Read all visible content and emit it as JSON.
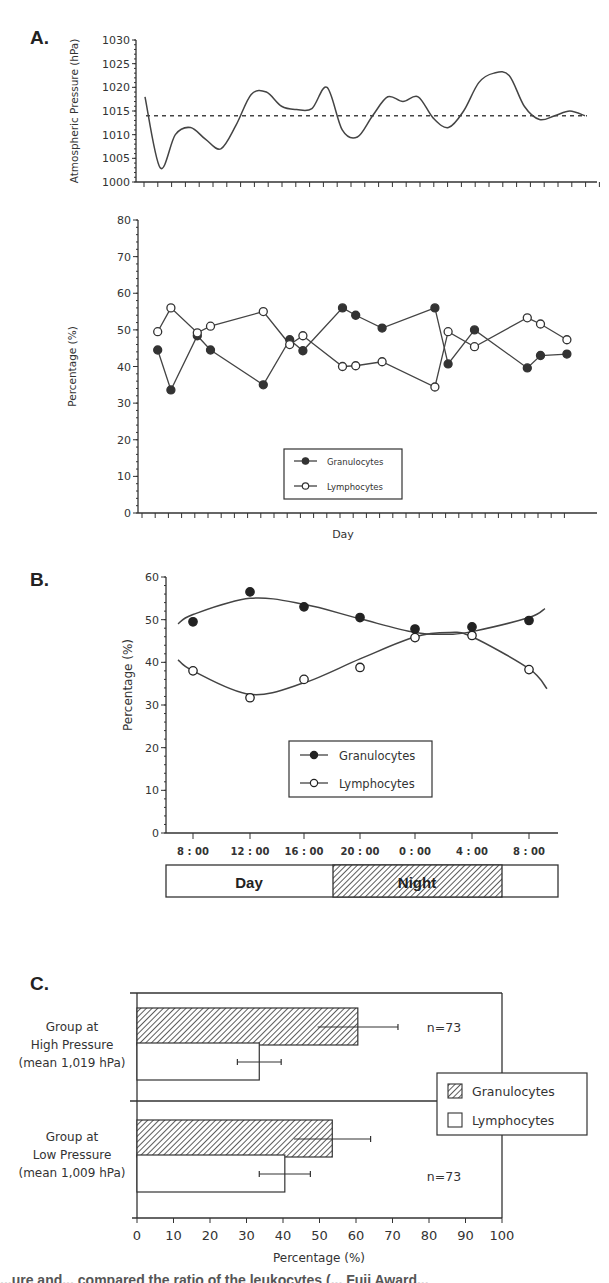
{
  "panels": {
    "A": {
      "letter": "A."
    },
    "B": {
      "letter": "B."
    },
    "C": {
      "letter": "C."
    }
  },
  "chart_data": [
    {
      "id": "A-pressure",
      "type": "line",
      "title": "",
      "xlabel": "",
      "ylabel": "Atmospheric Pressure (hPa)",
      "ylim": [
        1000,
        1030
      ],
      "yticks": [
        1000,
        1005,
        1010,
        1015,
        1020,
        1025,
        1030
      ],
      "reference_line": {
        "y": 1014,
        "style": "dashed"
      },
      "series": [
        {
          "name": "Pressure",
          "x": [
            0,
            0.5,
            1.2,
            2,
            2.8,
            3.5,
            4.5,
            5.5,
            6.2,
            7,
            7.8,
            8.5,
            9.2,
            10,
            10.8,
            11.5,
            12.5,
            13.5,
            14.5,
            15.5,
            16.2,
            17.2,
            18.2,
            19.2,
            20,
            21,
            22,
            23,
            24,
            25,
            26,
            27,
            28,
            28.8
          ],
          "values": [
            1018,
            1003,
            1010,
            1011.5,
            1009,
            1007,
            1012,
            1018.5,
            1019,
            1016,
            1015.3,
            1015.5,
            1020,
            1011,
            1009.5,
            1014,
            1018,
            1017,
            1018,
            1013.5,
            1011.5,
            1015,
            1021,
            1023,
            1022.5,
            1016,
            1013.2,
            1014,
            1015,
            1014
          ]
        }
      ],
      "grid": false
    },
    {
      "id": "A-percentage",
      "type": "line",
      "title": "",
      "xlabel": "Day",
      "ylabel": "Percentage (%)",
      "ylim": [
        0,
        80
      ],
      "yticks": [
        0,
        10,
        20,
        30,
        40,
        50,
        60,
        70,
        80
      ],
      "x_tick_count": 33,
      "x": [
        1,
        2,
        4,
        5,
        9,
        11,
        12,
        15,
        16,
        18,
        22,
        23,
        25,
        29,
        30,
        32
      ],
      "series": [
        {
          "name": "Granulocytes",
          "marker": "filled-circle",
          "values": [
            44.5,
            33.6,
            48.4,
            44.5,
            35.0,
            47.3,
            44.3,
            56.0,
            54.0,
            50.5,
            56.0,
            40.7,
            50.0,
            39.6,
            43.0,
            43.4
          ]
        },
        {
          "name": "Lymphocytes",
          "marker": "open-circle",
          "values": [
            49.5,
            56.0,
            49.2,
            51.0,
            55.0,
            46.0,
            48.4,
            40.0,
            40.2,
            41.3,
            34.4,
            49.5,
            45.4,
            53.3,
            51.6,
            47.3
          ]
        }
      ],
      "legend": {
        "position": "lower-center",
        "entries": [
          "Granulocytes",
          "Lymphocytes"
        ]
      },
      "grid": false
    },
    {
      "id": "B-circadian",
      "type": "scatter",
      "title": "",
      "xlabel": "",
      "ylabel": "Percentage (%)",
      "ylim": [
        0,
        60
      ],
      "yticks": [
        0,
        10,
        20,
        30,
        40,
        50,
        60
      ],
      "categories": [
        "8 : 00",
        "12 : 00",
        "16 : 00",
        "20 : 00",
        "0 : 00",
        "4 : 00",
        "8 : 00"
      ],
      "series": [
        {
          "name": "Granulocytes",
          "marker": "filled-circle",
          "values": [
            49.5,
            56.5,
            53.0,
            50.5,
            47.8,
            48.3,
            49.8
          ],
          "fit": "polynomial"
        },
        {
          "name": "Lymphocytes",
          "marker": "open-circle",
          "values": [
            38.0,
            31.7,
            36.0,
            38.8,
            45.8,
            46.3,
            38.3
          ],
          "fit": "polynomial"
        }
      ],
      "legend": {
        "position": "lower-center",
        "entries": [
          "Granulocytes",
          "Lymphocytes"
        ]
      },
      "day_night_bar": {
        "day_label": "Day",
        "night_label": "Night"
      },
      "grid": false
    },
    {
      "id": "C-groups",
      "type": "bar",
      "orientation": "horizontal",
      "title": "",
      "xlabel": "Percentage (%)",
      "ylabel": "",
      "xlim": [
        0,
        100
      ],
      "xticks": [
        0,
        10,
        20,
        30,
        40,
        50,
        60,
        70,
        80,
        90,
        100
      ],
      "categories": [
        {
          "lines": [
            "Group at",
            "High Pressure",
            "(mean  1,019 hPa)"
          ],
          "n_label": "n=73"
        },
        {
          "lines": [
            "Group at",
            "Low Pressure",
            "(mean  1,009 hPa)"
          ],
          "n_label": "n=73"
        }
      ],
      "series": [
        {
          "name": "Granulocytes",
          "fill": "hatched",
          "values": [
            60.5,
            53.5
          ],
          "error": [
            11,
            10.5
          ]
        },
        {
          "name": "Lymphocytes",
          "fill": "white",
          "values": [
            33.5,
            40.5
          ],
          "error": [
            6,
            7
          ]
        }
      ],
      "legend": {
        "position": "right",
        "entries": [
          "Granulocytes",
          "Lymphocytes"
        ]
      },
      "grid": false
    }
  ],
  "caption_fragment": "...ure and... compared the ratio of the leukocytes (... Fuji Award..."
}
